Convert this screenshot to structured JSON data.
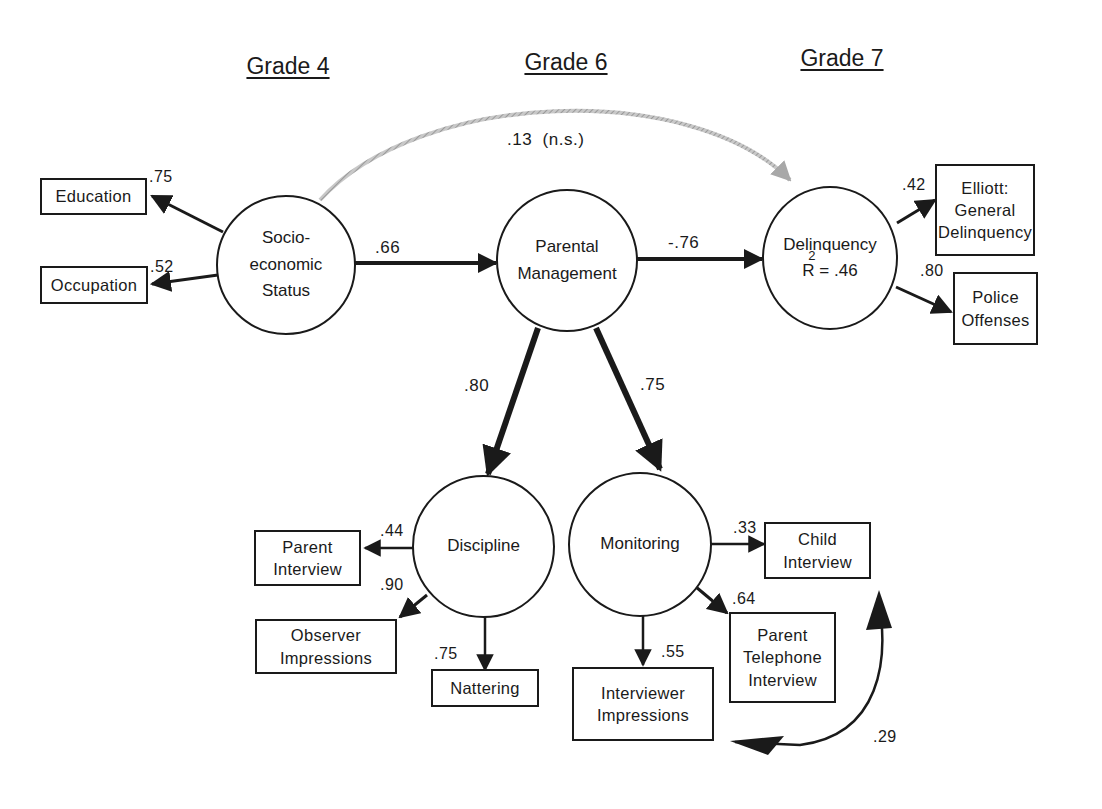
{
  "diagram": {
    "type": "structural-equation-path-model",
    "grades": [
      {
        "id": "grade4",
        "label": "Grade 4"
      },
      {
        "id": "grade6",
        "label": "Grade 6"
      },
      {
        "id": "grade7",
        "label": "Grade 7"
      }
    ],
    "latent_nodes": {
      "ses": {
        "lines": [
          "Socio-",
          "economic",
          "Status"
        ]
      },
      "parental_management": {
        "lines": [
          "Parental",
          "Management"
        ]
      },
      "delinquency": {
        "lines": [
          "Delinquency"
        ],
        "r_squared_label": "R",
        "r_squared_exp": "2",
        "r_squared_value": " = .46"
      },
      "discipline": {
        "lines": [
          "Discipline"
        ]
      },
      "monitoring": {
        "lines": [
          "Monitoring"
        ]
      }
    },
    "indicator_nodes": {
      "education": {
        "lines": [
          "Education"
        ]
      },
      "occupation": {
        "lines": [
          "Occupation"
        ]
      },
      "elliott": {
        "lines": [
          "Elliott:",
          "General",
          "Delinquency"
        ]
      },
      "police": {
        "lines": [
          "Police",
          "Offenses"
        ]
      },
      "parent_interview": {
        "lines": [
          "Parent",
          "Interview"
        ]
      },
      "observer_impressions": {
        "lines": [
          "Observer",
          "Impressions"
        ]
      },
      "nattering": {
        "lines": [
          "Nattering"
        ]
      },
      "child_interview": {
        "lines": [
          "Child",
          "Interview"
        ]
      },
      "parent_telephone": {
        "lines": [
          "Parent",
          "Telephone",
          "Interview"
        ]
      },
      "interviewer_impressions": {
        "lines": [
          "Interviewer",
          "Impressions"
        ]
      }
    },
    "paths": [
      {
        "from": "ses",
        "to": "parental_management",
        "coef": ".66"
      },
      {
        "from": "parental_management",
        "to": "delinquency",
        "coef": "-.76"
      },
      {
        "from": "ses",
        "to": "delinquency",
        "coef": ".13  (n.s.)",
        "style": "gray-curved",
        "color": "#a8a8a8"
      },
      {
        "from": "parental_management",
        "to": "discipline",
        "coef": ".80"
      },
      {
        "from": "parental_management",
        "to": "monitoring",
        "coef": ".75"
      },
      {
        "from": "ses",
        "to": "education",
        "coef": ".75"
      },
      {
        "from": "ses",
        "to": "occupation",
        "coef": ".52"
      },
      {
        "from": "delinquency",
        "to": "elliott",
        "coef": ".42"
      },
      {
        "from": "delinquency",
        "to": "police",
        "coef": ".80"
      },
      {
        "from": "discipline",
        "to": "parent_interview",
        "coef": ".44"
      },
      {
        "from": "discipline",
        "to": "observer_impressions",
        "coef": ".90"
      },
      {
        "from": "discipline",
        "to": "nattering",
        "coef": ".75"
      },
      {
        "from": "monitoring",
        "to": "child_interview",
        "coef": ".33"
      },
      {
        "from": "monitoring",
        "to": "parent_telephone",
        "coef": ".64"
      },
      {
        "from": "monitoring",
        "to": "interviewer_impressions",
        "coef": ".55"
      },
      {
        "from": "child_interview",
        "to": "interviewer_impressions",
        "coef": ".29",
        "style": "correlated-error-curved"
      }
    ]
  }
}
